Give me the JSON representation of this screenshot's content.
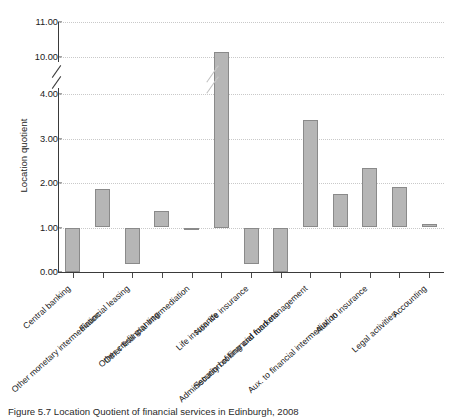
{
  "chart_data": {
    "type": "bar",
    "title": "",
    "xlabel": "",
    "ylabel": "Location quotient",
    "baseline": 1.0,
    "grid": true,
    "legend": "none",
    "axis_break": {
      "from": 4.0,
      "to": 10.0,
      "present": true
    },
    "ytick_labels": [
      "0.00",
      "1.00",
      "2.00",
      "3.00",
      "4.00",
      "10.00",
      "11.00"
    ],
    "ytick_values": [
      0.0,
      1.0,
      2.0,
      3.0,
      4.0,
      10.0,
      11.0
    ],
    "ylim": [
      0.0,
      11.0
    ],
    "categories": [
      "Central banking",
      "Other monetary intermediation",
      "Financial leasing",
      "Other credit granting",
      "Other financial intermediation",
      "Life insurance",
      "Non-life insurance",
      "Administration of financial markets",
      "Security broking and fund management",
      "Aux. to financial intermediation",
      "Aux. to insurance",
      "Legal activities",
      "Accounting"
    ],
    "values": [
      0.0,
      1.87,
      0.18,
      1.38,
      0.94,
      10.15,
      0.18,
      0.0,
      3.42,
      1.76,
      2.33,
      1.92,
      1.07
    ],
    "series": [
      {
        "name": "Location quotient",
        "values": [
          0.0,
          1.87,
          0.18,
          1.38,
          0.94,
          10.15,
          0.18,
          0.0,
          3.42,
          1.76,
          2.33,
          1.92,
          1.07
        ]
      }
    ],
    "colors": {
      "bar_fill": "#b6b6b6",
      "bar_stroke": "#8a8a8a",
      "grid": "#c9c9c9",
      "axis": "#3a3a3a"
    }
  },
  "caption": {
    "text": "Figure 5.7 Location Quotient of financial services in Edinburgh, 2008"
  }
}
